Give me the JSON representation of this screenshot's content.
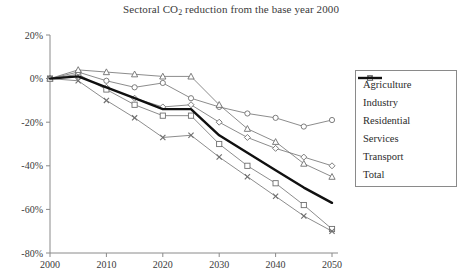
{
  "chart_data": {
    "type": "line",
    "title": "Sectoral CO2 reduction from the base year 2000",
    "title_main": "Sectoral CO",
    "title_sub": "2",
    "title_rest": " reduction from the base year 2000",
    "xlabel": "",
    "ylabel": "",
    "x": [
      2000,
      2005,
      2010,
      2015,
      2020,
      2025,
      2030,
      2035,
      2040,
      2045,
      2050
    ],
    "xlim": [
      2000,
      2050
    ],
    "ylim": [
      -80,
      20
    ],
    "xticks": [
      2000,
      2010,
      2020,
      2030,
      2040,
      2050
    ],
    "xtick_labels": [
      "2000",
      "2010",
      "2020",
      "2030",
      "2040",
      "2050"
    ],
    "yticks": [
      20,
      0,
      -20,
      -40,
      -60,
      -80
    ],
    "ytick_labels": [
      "20%",
      "0%",
      "-20%",
      "-40%",
      "-60%",
      "-80%"
    ],
    "grid": false,
    "legend_position": "right",
    "series": [
      {
        "name": "Agriculture",
        "marker": "diamond",
        "values": [
          0,
          1,
          -4,
          -9,
          -13,
          -12,
          -20,
          -27,
          -32,
          -36,
          -40
        ]
      },
      {
        "name": "Industry",
        "marker": "square",
        "values": [
          0,
          2,
          -5,
          -12,
          -17,
          -17,
          -30,
          -40,
          -48,
          -58,
          -69
        ]
      },
      {
        "name": "Residential",
        "marker": "circle",
        "values": [
          0,
          3,
          -1,
          -4,
          -2,
          -9,
          -13,
          -16,
          -18,
          -22,
          -19
        ]
      },
      {
        "name": "Services",
        "marker": "cross",
        "values": [
          0,
          -1,
          -10,
          -18,
          -27,
          -26,
          -36,
          -45,
          -54,
          -63,
          -70
        ]
      },
      {
        "name": "Transport",
        "marker": "triangle",
        "values": [
          0,
          4,
          3,
          2,
          1,
          1,
          -12,
          -23,
          -29,
          -39,
          -45
        ]
      },
      {
        "name": "Total",
        "marker": "none",
        "values": [
          0,
          1,
          -4,
          -9,
          -14,
          -14,
          -26,
          -34,
          -42,
          -50,
          -57
        ]
      }
    ]
  },
  "legend": {
    "items": [
      {
        "label": "Agriculture",
        "marker": "diamond"
      },
      {
        "label": "Industry",
        "marker": "square"
      },
      {
        "label": "Residential",
        "marker": "circle"
      },
      {
        "label": "Services",
        "marker": "cross"
      },
      {
        "label": "Transport",
        "marker": "triangle"
      },
      {
        "label": "Total",
        "marker": "none"
      }
    ]
  },
  "colors": {
    "line": "#6f6f6f",
    "total": "#101010",
    "axis": "#8a8a8a",
    "text": "#2b2b2b"
  }
}
